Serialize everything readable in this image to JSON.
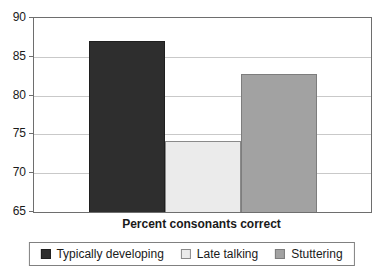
{
  "chart_data": {
    "type": "bar",
    "categories": [
      "Typically developing",
      "Late talking",
      "Stuttering"
    ],
    "values": [
      87,
      74.2,
      82.8
    ],
    "title": "",
    "xlabel": "Percent consonants correct",
    "ylabel": "",
    "ylim": [
      65,
      90
    ],
    "yticks": [
      65,
      70,
      75,
      80,
      85,
      90
    ],
    "grid": true,
    "legend_position": "bottom",
    "bar_colors": [
      "#2e2e2e",
      "#ebebeb",
      "#a2a2a2"
    ],
    "bar_border_colors": [
      "#1f1f1f",
      "#8a8a8a",
      "#7d7d7d"
    ],
    "gridline_color": "#c9c9c9",
    "axis_color": "#6e6e6e",
    "text_color": "#1a1a1a"
  }
}
